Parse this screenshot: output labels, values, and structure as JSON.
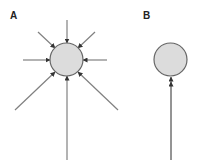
{
  "panels": [
    {
      "label": "A",
      "description": "Circle with eight converging arrows pointing inward from all directions",
      "circle": {
        "cx": 66.5,
        "cy": 59.5,
        "r": 16.5
      },
      "arrows": [
        {
          "name": "top",
          "x1": 67,
          "y1": 20,
          "x2": 67,
          "y2": 43
        },
        {
          "name": "top-left",
          "x1": 38,
          "y1": 32,
          "x2": 55,
          "y2": 48
        },
        {
          "name": "top-right",
          "x1": 95,
          "y1": 32,
          "x2": 78,
          "y2": 48
        },
        {
          "name": "left",
          "x1": 23,
          "y1": 60,
          "x2": 50,
          "y2": 60
        },
        {
          "name": "right",
          "x1": 107,
          "y1": 60,
          "x2": 83,
          "y2": 60
        },
        {
          "name": "bottom-left",
          "x1": 15,
          "y1": 110,
          "x2": 55,
          "y2": 72
        },
        {
          "name": "bottom-right",
          "x1": 118,
          "y1": 110,
          "x2": 78,
          "y2": 72
        },
        {
          "name": "bottom",
          "x1": 67,
          "y1": 160,
          "x2": 67,
          "y2": 76
        }
      ]
    },
    {
      "label": "B",
      "description": "Circle with a single long arrow from below with a double arrowhead",
      "circle": {
        "cx": 170.5,
        "cy": 59.5,
        "r": 16.5
      },
      "arrows": [
        {
          "name": "bottom",
          "x1": 171,
          "y1": 160,
          "x2": 171,
          "y2": 77,
          "double_head": true
        }
      ]
    }
  ],
  "colors": {
    "circle_fill": "#dcdcdc",
    "circle_stroke": "#666666",
    "line": "#808080",
    "arrowhead": "#333333",
    "label": "#222222"
  }
}
